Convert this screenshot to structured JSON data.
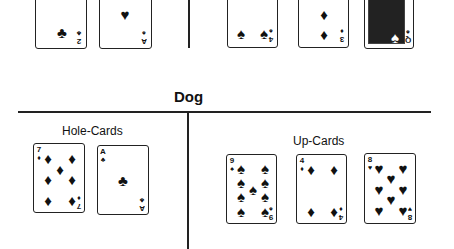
{
  "section_title": "Dog",
  "labels": {
    "hole": "Hole-Cards",
    "up": "Up-Cards"
  },
  "top_partial_cards": [
    {
      "rank": "2",
      "suit": "♣"
    },
    {
      "rank": "A",
      "suit": "♥"
    },
    {
      "rank": "4",
      "suit": "♠"
    },
    {
      "rank": "3",
      "suit": "♦"
    },
    {
      "rank": "Q",
      "suit": "♠"
    }
  ],
  "dog": {
    "hole_cards": [
      {
        "rank": "7",
        "suit": "♦"
      },
      {
        "rank": "A",
        "suit": "♣"
      }
    ],
    "up_cards": [
      {
        "rank": "9",
        "suit": "♠"
      },
      {
        "rank": "4",
        "suit": "♦"
      },
      {
        "rank": "8",
        "suit": "♥"
      }
    ]
  }
}
